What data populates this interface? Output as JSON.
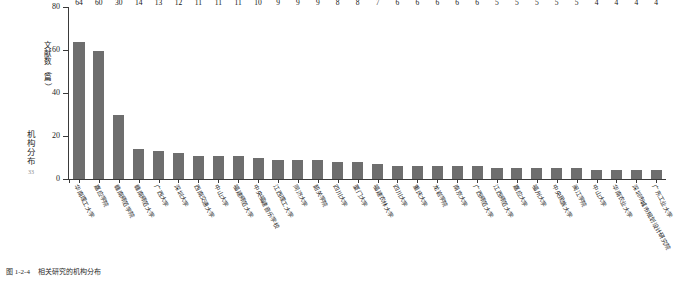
{
  "marginalia": {
    "chars": [
      "机",
      "构",
      "分",
      "布"
    ],
    "page_number": "33"
  },
  "caption": {
    "number": "图 1-2-4",
    "text": "相关研究的机构分布"
  },
  "chart_data": {
    "type": "bar",
    "title": "相关研究的机构分布",
    "xlabel": "",
    "ylabel": "文献数（篇）",
    "ylabel_chars": [
      "文",
      "献",
      "数",
      "（",
      "篇",
      "）"
    ],
    "ylim": [
      0,
      80
    ],
    "yticks": [
      0,
      20,
      40,
      60,
      80
    ],
    "ytick_labels": [
      "0",
      "20",
      "40",
      "60",
      "80"
    ],
    "grid": false,
    "legend": null,
    "bar_color": "#6e6e6e",
    "categories": [
      "华南理工大学",
      "嘉应学院",
      "赣南师范学院",
      "赣南师范大学",
      "广西大学",
      "深圳大学",
      "西南交通大学",
      "中山大学",
      "福建师范大学",
      "中央福建音乐学校",
      "江西理工大学",
      "同济大学",
      "韶关学院",
      "四川大学",
      "厦门大学",
      "福建农林大学",
      "四川大学",
      "重庆大学",
      "龙岩学院",
      "南京大学",
      "广西师范大学",
      "江西师范大学",
      "嘉应大学",
      "福州大学",
      "中央民族大学",
      "闽江学院",
      "中山大学",
      "华南农业大学",
      "深圳市城市规划设计研究院",
      "广东工业大学"
    ],
    "values": [
      64,
      60,
      30,
      14,
      13,
      12,
      11,
      11,
      11,
      10,
      9,
      9,
      9,
      8,
      8,
      7,
      6,
      6,
      6,
      6,
      6,
      5,
      5,
      5,
      5,
      5,
      4,
      4,
      4,
      4
    ],
    "value_labels": [
      "64",
      "60",
      "30",
      "14",
      "13",
      "12",
      "11",
      "11",
      "11",
      "10",
      "9",
      "9",
      "9",
      "8",
      "8",
      "7",
      "6",
      "6",
      "6",
      "6",
      "6",
      "5",
      "5",
      "5",
      "5",
      "5",
      "4",
      "4",
      "4",
      "4"
    ]
  }
}
